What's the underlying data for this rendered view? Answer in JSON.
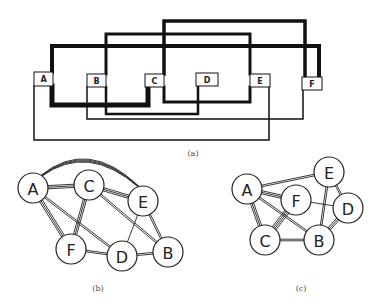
{
  "figure": {
    "panel_a": {
      "caption": "(a)",
      "boxes": [
        {
          "id": "A",
          "label": "A",
          "x": 34,
          "y": 72,
          "w": 19,
          "h": 14
        },
        {
          "id": "B",
          "label": "B",
          "x": 87,
          "y": 74,
          "w": 19,
          "h": 13
        },
        {
          "id": "C",
          "label": "C",
          "x": 145,
          "y": 74,
          "w": 19,
          "h": 13
        },
        {
          "id": "D",
          "label": "D",
          "x": 196,
          "y": 73,
          "w": 22,
          "h": 13
        },
        {
          "id": "E",
          "label": "E",
          "x": 250,
          "y": 74,
          "w": 20,
          "h": 13
        },
        {
          "id": "F",
          "label": "F",
          "x": 302,
          "y": 77,
          "w": 20,
          "h": 13
        }
      ],
      "wires": [
        {
          "from": "A",
          "to": "F",
          "weight": 4,
          "points": "52,72 52,46 319,46 319,77"
        },
        {
          "from": "B",
          "to": "E",
          "weight": 3,
          "points": "106,74 106,34 250,34 250,74"
        },
        {
          "from": "C",
          "to": "F",
          "weight": 3.5,
          "points": "164,74 164,21 305,21 305,77"
        },
        {
          "from": "A",
          "to": "C",
          "weight": 5,
          "points": "52,86 52,105 148,105 148,87"
        },
        {
          "from": "C",
          "to": "E",
          "weight": 3,
          "points": "164,87 164,102 250,102 250,87"
        },
        {
          "from": "B",
          "to": "D",
          "weight": 2.5,
          "points": "106,87 106,114 198,114 198,86"
        },
        {
          "from": "B",
          "to": "F",
          "weight": 1.5,
          "points": "87,87 87,119 303,119 303,90"
        },
        {
          "from": "A",
          "to": "E",
          "weight": 1.5,
          "points": "34,86 34,140 269,140 269,87"
        }
      ]
    },
    "panel_b": {
      "caption": "(b)",
      "nodes": [
        {
          "id": "A",
          "label": "A",
          "cx": 33,
          "cy": 188
        },
        {
          "id": "C",
          "label": "C",
          "cx": 89,
          "cy": 185
        },
        {
          "id": "E",
          "label": "E",
          "cx": 143,
          "cy": 201
        },
        {
          "id": "F",
          "label": "F",
          "cx": 71,
          "cy": 249
        },
        {
          "id": "D",
          "label": "D",
          "cx": 122,
          "cy": 256
        },
        {
          "id": "B",
          "label": "B",
          "cx": 168,
          "cy": 252
        }
      ],
      "edges": [
        {
          "from": "A",
          "to": "E",
          "multiplicity": 4,
          "curved": true
        },
        {
          "from": "A",
          "to": "C",
          "multiplicity": 3
        },
        {
          "from": "C",
          "to": "E",
          "multiplicity": 3
        },
        {
          "from": "A",
          "to": "F",
          "multiplicity": 3
        },
        {
          "from": "A",
          "to": "D",
          "multiplicity": 2
        },
        {
          "from": "C",
          "to": "F",
          "multiplicity": 3
        },
        {
          "from": "C",
          "to": "B",
          "multiplicity": 2
        },
        {
          "from": "E",
          "to": "D",
          "multiplicity": 1
        },
        {
          "from": "E",
          "to": "B",
          "multiplicity": 2
        },
        {
          "from": "F",
          "to": "D",
          "multiplicity": 2
        },
        {
          "from": "D",
          "to": "B",
          "multiplicity": 2
        }
      ]
    },
    "panel_c": {
      "caption": "(c)",
      "nodes": [
        {
          "id": "A",
          "label": "A",
          "cx": 247,
          "cy": 189
        },
        {
          "id": "E",
          "label": "E",
          "cx": 329,
          "cy": 172
        },
        {
          "id": "F",
          "label": "F",
          "cx": 296,
          "cy": 200
        },
        {
          "id": "D",
          "label": "D",
          "cx": 348,
          "cy": 208
        },
        {
          "id": "C",
          "label": "C",
          "cx": 265,
          "cy": 240
        },
        {
          "id": "B",
          "label": "B",
          "cx": 319,
          "cy": 240
        }
      ],
      "edges": [
        {
          "from": "A",
          "to": "E",
          "multiplicity": 2
        },
        {
          "from": "A",
          "to": "F",
          "multiplicity": 3
        },
        {
          "from": "A",
          "to": "C",
          "multiplicity": 3
        },
        {
          "from": "A",
          "to": "B",
          "multiplicity": 2
        },
        {
          "from": "F",
          "to": "C",
          "multiplicity": 4
        },
        {
          "from": "F",
          "to": "D",
          "multiplicity": 1
        },
        {
          "from": "E",
          "to": "D",
          "multiplicity": 2
        },
        {
          "from": "E",
          "to": "B",
          "multiplicity": 2
        },
        {
          "from": "D",
          "to": "B",
          "multiplicity": 3
        },
        {
          "from": "C",
          "to": "B",
          "multiplicity": 2
        }
      ]
    }
  }
}
